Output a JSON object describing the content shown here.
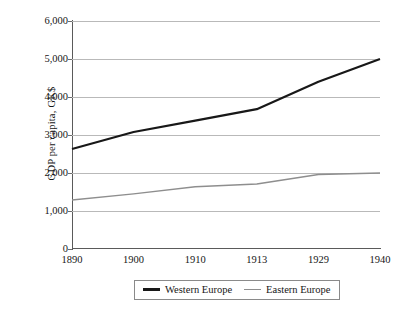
{
  "chart_data": {
    "type": "line",
    "title": "",
    "xlabel": "",
    "ylabel": "GDP per capita, GK$",
    "categories": [
      "1890",
      "1900",
      "1910",
      "1913",
      "1929",
      "1940"
    ],
    "ylim": [
      0,
      6000
    ],
    "ytick_values": [
      0,
      1000,
      2000,
      3000,
      4000,
      5000,
      6000
    ],
    "ytick_labels": [
      "0",
      "1,000",
      "2,000",
      "3,000",
      "4,000",
      "5,000",
      "6,000"
    ],
    "grid": "horizontal",
    "legend_position": "bottom",
    "series": [
      {
        "name": "Western Europe",
        "color": "#181818",
        "width": 2.2,
        "values": [
          2630,
          3080,
          3380,
          3680,
          4400,
          5000
        ]
      },
      {
        "name": "Eastern Europe",
        "color": "#8e8e8e",
        "width": 1.4,
        "values": [
          1290,
          1450,
          1640,
          1710,
          1960,
          2000
        ]
      }
    ]
  },
  "axis": {
    "y_title": "GDP per capita, GK$"
  },
  "legend": {
    "entries": [
      {
        "label": "Western Europe",
        "swatch": "western-europe-line-swatch"
      },
      {
        "label": "Eastern Europe",
        "swatch": "eastern-europe-line-swatch"
      }
    ]
  }
}
